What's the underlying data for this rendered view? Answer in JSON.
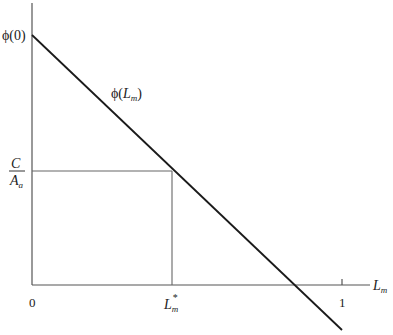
{
  "diagram": {
    "y_axis_top_label": "ϕ(0)",
    "curve_label": "ϕ(",
    "curve_label_var": "L",
    "curve_label_sub": "m",
    "curve_label_close": ")",
    "fraction_numerator": "C",
    "fraction_denominator": "A",
    "fraction_denominator_sub": "a",
    "x_origin_label": "0",
    "x_star_label": "L",
    "x_star_sub": "m",
    "x_star_sup": "*",
    "x_one_label": "1",
    "x_axis_label": "L",
    "x_axis_label_sub": "m",
    "colors": {
      "axis": "#555555",
      "curve": "#1a1a1a",
      "guide": "#666666"
    }
  }
}
